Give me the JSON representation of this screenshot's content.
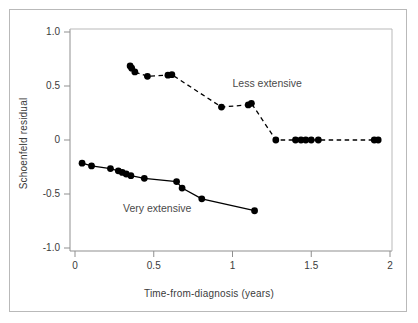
{
  "chart_data": {
    "type": "scatter",
    "title": "",
    "xlabel": "Time-from-diagnosis (years)",
    "ylabel": "Schoenfeld residual",
    "xlim": [
      -0.02,
      2.04
    ],
    "ylim": [
      -1.06,
      1.06
    ],
    "xticks": [
      0,
      0.5,
      1,
      1.5,
      2
    ],
    "xticklabels": [
      "0",
      "0.5",
      "1",
      "1.5",
      "2"
    ],
    "yticks": [
      1.0,
      0.5,
      0,
      -0.5,
      -1.0
    ],
    "yticklabels": [
      "1.0",
      "0.5",
      "0",
      "-0.5",
      "-1.0"
    ],
    "grid": false,
    "legend_position": "inline-annotation",
    "series": [
      {
        "name": "Less extensive",
        "linestyle": "dashed",
        "color": "#000000",
        "marker": "circle",
        "annotation": "Less extensive",
        "annotation_x": 1.0,
        "annotation_y": 0.52,
        "points": [
          {
            "x": 0.35,
            "y": 0.685
          },
          {
            "x": 0.36,
            "y": 0.665
          },
          {
            "x": 0.38,
            "y": 0.63
          },
          {
            "x": 0.46,
            "y": 0.59
          },
          {
            "x": 0.59,
            "y": 0.6
          },
          {
            "x": 0.615,
            "y": 0.605
          },
          {
            "x": 0.93,
            "y": 0.305
          },
          {
            "x": 1.1,
            "y": 0.325
          },
          {
            "x": 1.12,
            "y": 0.34
          },
          {
            "x": 1.275,
            "y": 0.0
          },
          {
            "x": 1.4,
            "y": 0.0
          },
          {
            "x": 1.435,
            "y": 0.0
          },
          {
            "x": 1.465,
            "y": 0.0
          },
          {
            "x": 1.5,
            "y": 0.0
          },
          {
            "x": 1.545,
            "y": 0.0
          },
          {
            "x": 1.9,
            "y": 0.0
          },
          {
            "x": 1.925,
            "y": 0.0
          }
        ]
      },
      {
        "name": "Very extensive",
        "linestyle": "solid",
        "color": "#000000",
        "marker": "circle",
        "annotation": "Very extensive",
        "annotation_x": 0.305,
        "annotation_y": -0.635,
        "points": [
          {
            "x": 0.045,
            "y": -0.215
          },
          {
            "x": 0.105,
            "y": -0.24
          },
          {
            "x": 0.225,
            "y": -0.265
          },
          {
            "x": 0.275,
            "y": -0.285
          },
          {
            "x": 0.3,
            "y": -0.3
          },
          {
            "x": 0.325,
            "y": -0.315
          },
          {
            "x": 0.355,
            "y": -0.33
          },
          {
            "x": 0.44,
            "y": -0.355
          },
          {
            "x": 0.645,
            "y": -0.385
          },
          {
            "x": 0.68,
            "y": -0.445
          },
          {
            "x": 0.805,
            "y": -0.545
          },
          {
            "x": 1.14,
            "y": -0.655
          }
        ]
      }
    ]
  }
}
